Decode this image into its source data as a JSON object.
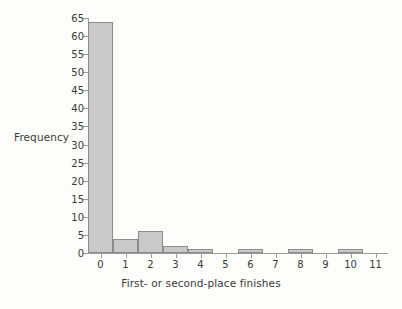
{
  "chart_data": {
    "type": "bar",
    "title": "",
    "xlabel": "First- or second-place finishes",
    "ylabel": "Frequency",
    "categories": [
      "0",
      "1",
      "2",
      "3",
      "4",
      "5",
      "6",
      "7",
      "8",
      "9",
      "10",
      "11"
    ],
    "values": [
      64,
      4,
      6,
      2,
      1,
      0,
      1,
      0,
      1,
      0,
      1,
      0
    ],
    "xlim": [
      -0.5,
      11.5
    ],
    "ylim": [
      0,
      65
    ],
    "yticks": [
      "0",
      "5",
      "10",
      "15",
      "20",
      "25",
      "30",
      "35",
      "40",
      "45",
      "50",
      "55",
      "60",
      "65"
    ],
    "ytick_values": [
      0,
      5,
      10,
      15,
      20,
      25,
      30,
      35,
      40,
      45,
      50,
      55,
      60,
      65
    ],
    "xticks": [
      "0",
      "1",
      "2",
      "3",
      "4",
      "5",
      "6",
      "7",
      "8",
      "9",
      "10",
      "11"
    ],
    "grid": false,
    "legend": null,
    "bar_fill_color": "#c9c9c9",
    "bar_border_color": "#8c8c8c",
    "axis_color": "#9a9a9a",
    "text_color": "#3a3a3a",
    "background_color": "#fdfdfc"
  }
}
